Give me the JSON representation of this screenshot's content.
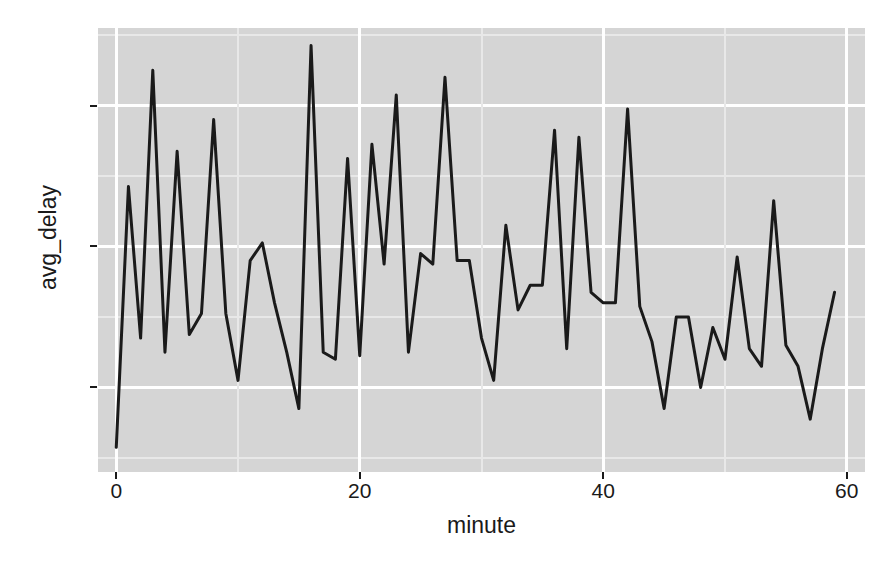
{
  "chart_data": {
    "type": "line",
    "title": "",
    "subtitle": "",
    "xlabel": "minute",
    "ylabel": "avg_delay",
    "xlim": [
      -1.5,
      61.5
    ],
    "ylim": [
      3.6,
      16.2
    ],
    "xticks": [
      0,
      20,
      40,
      60
    ],
    "xtick_labels": [
      "0",
      "20",
      "40",
      "60"
    ],
    "yticks": [
      6,
      10,
      14
    ],
    "ytick_labels": [
      "6",
      "10",
      "14"
    ],
    "x_minor_ticks": [
      10,
      30,
      50
    ],
    "y_minor_ticks": [
      4,
      8,
      12,
      16
    ],
    "grid": true,
    "legend": false,
    "legend_position": "none",
    "panel_background": "#d5d5d5",
    "gridline_color": "#ffffff",
    "line_color": "#1a1a1a",
    "line_width": 3,
    "x": [
      0,
      1,
      2,
      3,
      4,
      5,
      6,
      7,
      8,
      9,
      10,
      11,
      12,
      13,
      14,
      15,
      16,
      17,
      18,
      19,
      20,
      21,
      22,
      23,
      24,
      25,
      26,
      27,
      28,
      29,
      30,
      31,
      32,
      33,
      34,
      35,
      36,
      37,
      38,
      39,
      40,
      41,
      42,
      43,
      44,
      45,
      46,
      47,
      48,
      49,
      50,
      51,
      52,
      53,
      54,
      55,
      56,
      57,
      58,
      59
    ],
    "y": [
      4.3,
      11.7,
      7.4,
      15.0,
      7.0,
      12.7,
      7.5,
      8.1,
      13.6,
      8.1,
      6.2,
      9.6,
      10.1,
      8.4,
      7.0,
      5.4,
      15.7,
      7.0,
      6.8,
      12.5,
      6.9,
      12.9,
      9.5,
      14.3,
      7.0,
      9.8,
      9.5,
      14.8,
      9.6,
      9.6,
      7.4,
      6.2,
      10.6,
      8.2,
      8.9,
      8.9,
      13.3,
      7.1,
      13.1,
      8.7,
      8.4,
      8.4,
      13.9,
      8.3,
      7.3,
      5.4,
      8.0,
      8.0,
      6.0,
      7.7,
      6.8,
      9.7,
      7.1,
      6.6,
      11.3,
      7.2,
      6.6,
      5.1,
      7.1,
      8.7
    ],
    "series_name": "avg_delay"
  },
  "axis": {
    "y_title": "avg_delay",
    "x_title": "minute"
  }
}
